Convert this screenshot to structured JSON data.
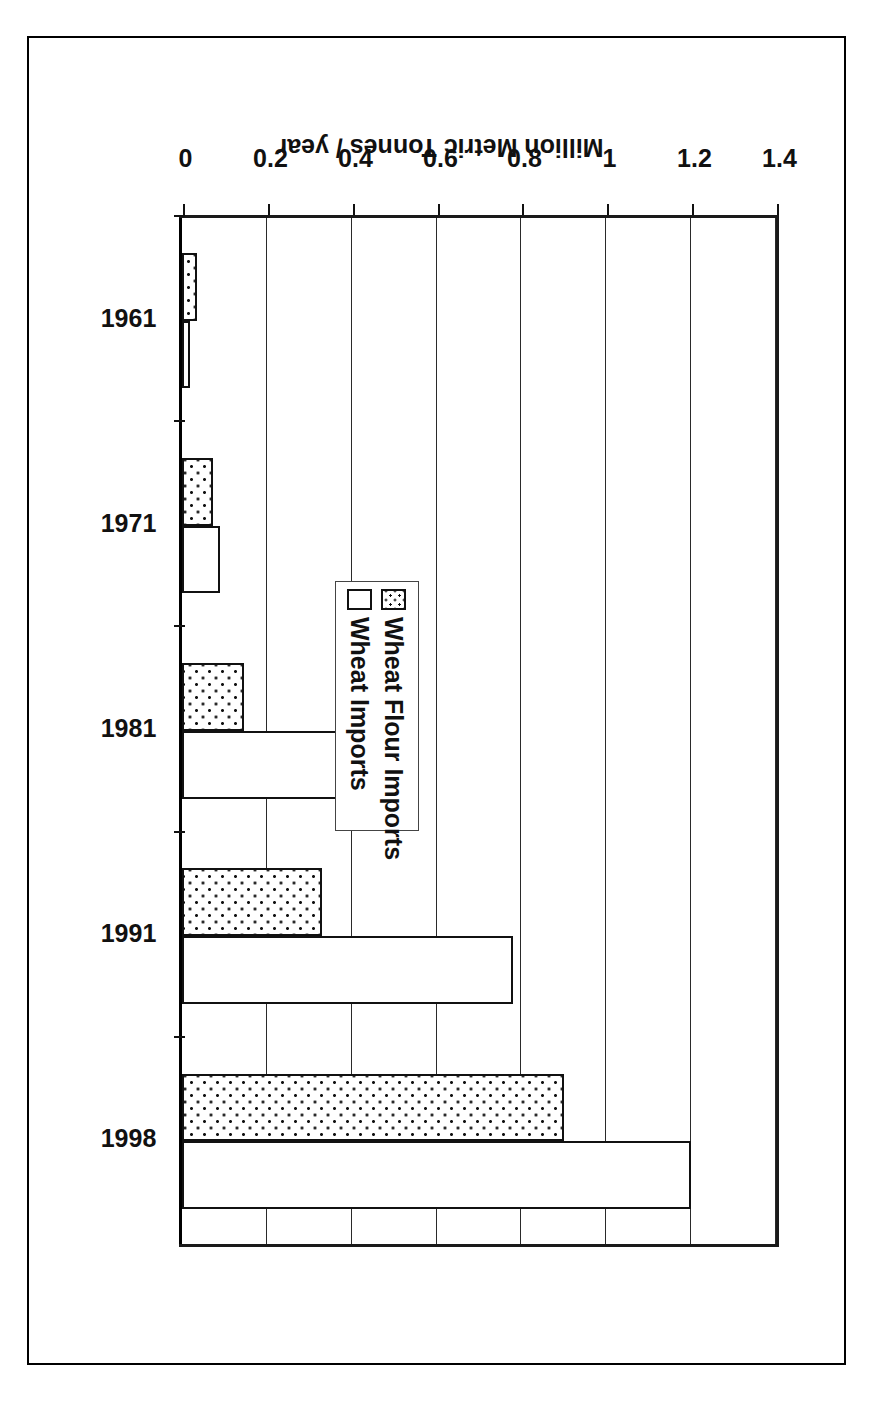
{
  "chart_data": {
    "type": "bar",
    "orientation": "horizontal",
    "title": "",
    "xlabel": "",
    "ylabel": "Million Metric Tonnes / year",
    "categories": [
      "1961",
      "1971",
      "1981",
      "1991",
      "1998"
    ],
    "value_ticks": [
      "0",
      "0.2",
      "0.4",
      "0.6",
      "0.8",
      "1",
      "1.2",
      "1.4"
    ],
    "value_tick_numbers": [
      0,
      0.2,
      0.4,
      0.6,
      0.8,
      1.0,
      1.2,
      1.4
    ],
    "ylim": [
      0,
      1.4
    ],
    "grid": true,
    "legend_position": "inside-left-middle",
    "series": [
      {
        "name": "Wheat Flour Imports",
        "pattern": "dotted",
        "values": [
          0.035,
          0.073,
          0.147,
          0.33,
          0.9
        ]
      },
      {
        "name": "Wheat Imports",
        "pattern": "solid-white",
        "values": [
          0.02,
          0.09,
          0.45,
          0.78,
          1.2
        ]
      }
    ]
  },
  "legend": {
    "items": [
      {
        "label": "Wheat Flour Imports",
        "key": "dotted-square-swatch"
      },
      {
        "label": "Wheat Imports",
        "key": "white-square-swatch"
      }
    ]
  },
  "axis": {
    "value_axis_title": "Million Metric Tonnes / year"
  }
}
